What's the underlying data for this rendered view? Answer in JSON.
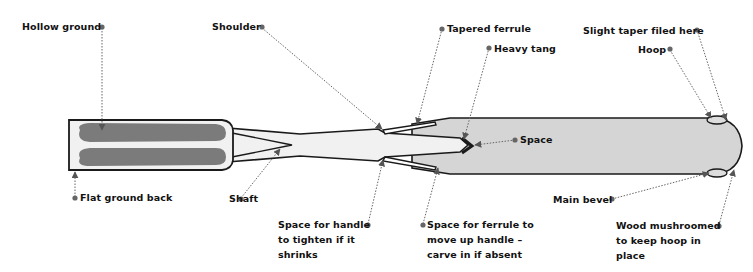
{
  "diagram": {
    "colors": {
      "outline": "#1a1a1a",
      "blade_hollow": "#7b7b7b",
      "steel_light": "#f1f1f1",
      "handle": "#d5d5d5",
      "leader": "#666666",
      "dot": "#666666"
    },
    "labels": {
      "hollow_ground": "Hollow ground",
      "flat_ground_back": "Flat ground back",
      "shoulder": "Shoulder",
      "shaft": "Shaft",
      "tapered_ferrule": "Tapered ferrule",
      "heavy_tang": "Heavy tang",
      "space": "Space",
      "space_handle": "Space for handle\nto tighten if it\nshrinks",
      "space_ferrule": "Space for ferrule to\nmove up handle –\ncarve in if absent",
      "slight_taper": "Slight taper filed here",
      "hoop": "Hoop",
      "main_bevel": "Main bevel",
      "wood_mushroomed": "Wood mushroomed\nto keep hoop in\nplace"
    }
  }
}
